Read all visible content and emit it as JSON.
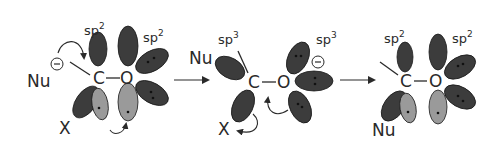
{
  "colors": {
    "dark_lobe": "#3c3c3c",
    "light_lobe": "#9a9a9a",
    "text": "#2a2a2a",
    "background": "#ffffff"
  },
  "step1": {
    "carbon": "C",
    "oxygen": "O",
    "nucleophile": "Nu",
    "charge": "−",
    "leaving_group": "X",
    "carbon_hybridization": "sp",
    "carbon_hybridization_sup": "2",
    "oxygen_hybridization": "sp",
    "oxygen_hybridization_sup": "2"
  },
  "step2": {
    "carbon": "C",
    "oxygen": "O",
    "nucleophile": "Nu",
    "charge": "−",
    "leaving_group": "X",
    "carbon_hybridization": "sp",
    "carbon_hybridization_sup": "3",
    "oxygen_hybridization": "sp",
    "oxygen_hybridization_sup": "3"
  },
  "step3": {
    "carbon": "C",
    "oxygen": "O",
    "nucleophile": "Nu",
    "carbon_hybridization": "sp",
    "carbon_hybridization_sup": "2",
    "oxygen_hybridization": "sp",
    "oxygen_hybridization_sup": "2"
  },
  "arrows": [
    "reaction-arrow-1",
    "reaction-arrow-2"
  ]
}
